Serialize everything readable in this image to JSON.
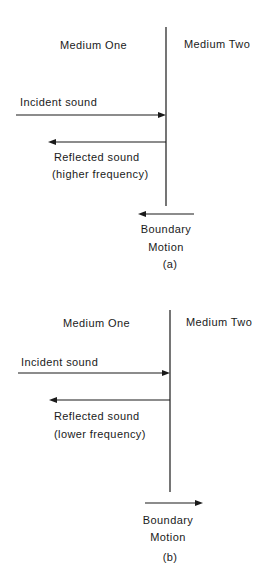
{
  "panels": [
    {
      "id": "a",
      "caption": "(a)",
      "medium_one": "Medium One",
      "medium_two": "Medium Two",
      "incident_label": "Incident sound",
      "reflected_label_line1": "Reflected sound",
      "reflected_label_line2": "(higher frequency)",
      "boundary_label_line1": "Boundary",
      "boundary_label_line2": "Motion",
      "boundary_motion_direction": "left"
    },
    {
      "id": "b",
      "caption": "(b)",
      "medium_one": "Medium One",
      "medium_two": "Medium Two",
      "incident_label": "Incident sound",
      "reflected_label_line1": "Reflected sound",
      "reflected_label_line2": "(lower frequency)",
      "boundary_label_line1": "Boundary",
      "boundary_label_line2": "Motion",
      "boundary_motion_direction": "right"
    }
  ]
}
